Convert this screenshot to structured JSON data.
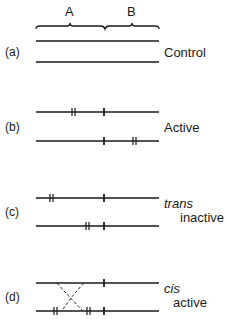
{
  "header": {
    "region_a_label": "A",
    "region_b_label": "B"
  },
  "panels": [
    {
      "id": "(a)",
      "label_lines": [
        "Control"
      ],
      "label_italic_first": false
    },
    {
      "id": "(b)",
      "label_lines": [
        "Active"
      ],
      "label_italic_first": false
    },
    {
      "id": "(c)",
      "label_lines": [
        "trans",
        "inactive"
      ],
      "label_italic_first": true
    },
    {
      "id": "(d)",
      "label_lines": [
        "cis",
        "active"
      ],
      "label_italic_first": true
    }
  ],
  "colors": {
    "line": "#1a1a1a",
    "background": "#ffffff"
  }
}
